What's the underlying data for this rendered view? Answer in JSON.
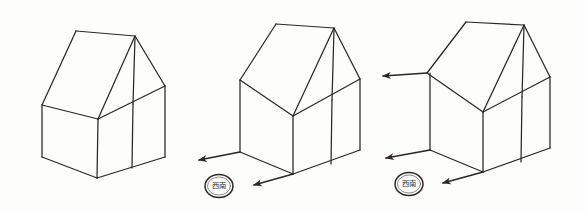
{
  "figure": {
    "medium": "pencil line drawing on white paper",
    "background_color": "#fdfdfc",
    "ink_color": "#2b2724",
    "panel_count": 3
  },
  "panels": [
    {
      "id": "panel-1",
      "order": "1",
      "caption": "",
      "arrow_count": "0",
      "stamp_text": "",
      "description": "Plain gabled box: no direction arrows drawn yet"
    },
    {
      "id": "panel-2",
      "order": "2",
      "caption": "",
      "arrow_count": "2",
      "stamp_text": "西南",
      "description": "Same box with two vanishing-direction arrows from the lower edges"
    },
    {
      "id": "panel-3",
      "order": "3",
      "caption": "",
      "arrow_count": "3",
      "stamp_text": "西南",
      "description": "Same box with three vanishing-direction arrows including one from the left eave"
    }
  ],
  "stamps": [
    {
      "id": "stamp-panel-2",
      "text": "西南",
      "x": "219",
      "y": "186"
    },
    {
      "id": "stamp-panel-3",
      "text": "西南",
      "x": "409",
      "y": "184"
    }
  ],
  "arrows": [
    {
      "id": "arrow-p2-left-base",
      "panel": "panel-2",
      "from_x": "240",
      "from_y": "152",
      "to_x": "197",
      "to_y": "161"
    },
    {
      "id": "arrow-p2-front-base",
      "panel": "panel-2",
      "from_x": "293",
      "from_y": "174",
      "to_x": "252",
      "to_y": "186"
    },
    {
      "id": "arrow-p3-left-eave",
      "panel": "panel-3",
      "from_x": "427",
      "from_y": "73",
      "to_x": "381",
      "to_y": "76"
    },
    {
      "id": "arrow-p3-left-base",
      "panel": "panel-3",
      "from_x": "430",
      "from_y": "150",
      "to_x": "384",
      "to_y": "159"
    },
    {
      "id": "arrow-p3-front-base",
      "panel": "panel-3",
      "from_x": "483",
      "from_y": "172",
      "to_x": "441",
      "to_y": "184"
    }
  ]
}
